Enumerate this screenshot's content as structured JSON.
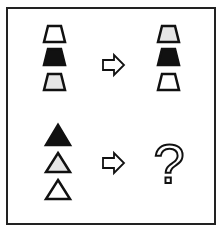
{
  "puzzle": {
    "rows": [
      {
        "left_shapes": [
          {
            "shape": "trapezoid",
            "fill": "#ffffff"
          },
          {
            "shape": "trapezoid",
            "fill": "#111111"
          },
          {
            "shape": "trapezoid",
            "fill": "#e6e6e6"
          }
        ],
        "arrow": "arrow-right-icon",
        "right_shapes": [
          {
            "shape": "trapezoid",
            "fill": "#e6e6e6"
          },
          {
            "shape": "trapezoid",
            "fill": "#111111"
          },
          {
            "shape": "trapezoid",
            "fill": "#ffffff"
          }
        ]
      },
      {
        "left_shapes": [
          {
            "shape": "triangle",
            "fill": "#111111"
          },
          {
            "shape": "triangle",
            "fill": "#e6e6e6"
          },
          {
            "shape": "triangle",
            "fill": "#ffffff"
          }
        ],
        "arrow": "arrow-right-icon",
        "answer": "?"
      }
    ]
  }
}
